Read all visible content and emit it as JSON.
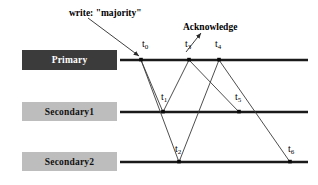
{
  "diagram": {
    "background": "#ffffff",
    "line_color": "#1a1a1a",
    "arrow_color": "#3a3a3a",
    "lanes": [
      {
        "id": "primary",
        "label": "Primary",
        "fill": "#3b3b3b",
        "text_color": "#ffffff",
        "y": 60
      },
      {
        "id": "secondary1",
        "label": "Secondary1",
        "fill": "#bdbdbd",
        "text_color": "#111111",
        "y": 112
      },
      {
        "id": "secondary2",
        "label": "Secondary2",
        "fill": "#bdbdbd",
        "text_color": "#111111",
        "y": 162
      }
    ],
    "annotations": [
      {
        "id": "write-label",
        "text": "write: \"majority\"",
        "x": 69,
        "y": 8
      },
      {
        "id": "acknowledge-label",
        "text": "Acknowledge",
        "x": 183,
        "y": 22
      }
    ],
    "events": [
      {
        "id": "t0",
        "label": "t",
        "sub": "0",
        "lane": "primary",
        "x": 141,
        "label_x": 142,
        "label_y": 38
      },
      {
        "id": "t1",
        "label": "t",
        "sub": "1",
        "lane": "secondary1",
        "x": 163,
        "label_x": 161,
        "label_y": 91
      },
      {
        "id": "t2",
        "label": "t",
        "sub": "2",
        "lane": "secondary2",
        "x": 179,
        "label_x": 175,
        "label_y": 143
      },
      {
        "id": "t3",
        "label": "t",
        "sub": "3",
        "lane": "primary",
        "x": 189,
        "label_x": 185,
        "label_y": 38
      },
      {
        "id": "t4",
        "label": "t",
        "sub": "4",
        "lane": "primary",
        "x": 219,
        "label_x": 215,
        "label_y": 38
      },
      {
        "id": "t5",
        "label": "t",
        "sub": "5",
        "lane": "secondary1",
        "x": 239,
        "label_x": 235,
        "label_y": 91
      },
      {
        "id": "t6",
        "label": "t",
        "sub": "6",
        "lane": "secondary2",
        "x": 290,
        "label_x": 288,
        "label_y": 143
      }
    ],
    "messages": [
      {
        "id": "msg-t0-t1",
        "from": "t0",
        "to": "t1"
      },
      {
        "id": "msg-t0-t2",
        "from": "t0",
        "to": "t2"
      },
      {
        "id": "msg-t1-t3",
        "from": "t1",
        "to": "t3"
      },
      {
        "id": "msg-t2-t4",
        "from": "t2",
        "to": "t4"
      },
      {
        "id": "msg-t3-t5",
        "from": "t3",
        "to": "t5"
      },
      {
        "id": "msg-t4-t6",
        "from": "t4",
        "to": "t6"
      }
    ],
    "pointers": [
      {
        "id": "write-pointer",
        "x1": 88,
        "y1": 18,
        "x2": 139,
        "y2": 56
      },
      {
        "id": "acknowledge-pointer",
        "x1": 186,
        "y1": 52,
        "x2": 201,
        "y2": 33
      }
    ],
    "timeline": {
      "x_start": 120,
      "x_end": 308
    }
  }
}
